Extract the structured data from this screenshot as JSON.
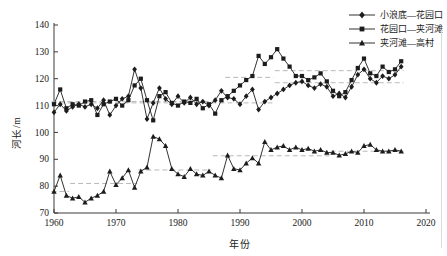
{
  "chart_data": {
    "type": "line",
    "title": "",
    "xlabel": "年份",
    "ylabel": "河长/m",
    "xlim": [
      1960,
      2020
    ],
    "ylim": [
      70,
      140
    ],
    "x_ticks": [
      1960,
      1970,
      1980,
      1990,
      2000,
      2010,
      2020
    ],
    "y_ticks": [
      70,
      80,
      90,
      100,
      110,
      120,
      130,
      140
    ],
    "grid": false,
    "legend_position": "top-right",
    "colors": {
      "line": "#1c1c1c",
      "mean_line": "#b9b9b9",
      "axis": "#3a3a3a",
      "background": "#ffffff"
    },
    "x": [
      1960,
      1961,
      1962,
      1963,
      1964,
      1965,
      1966,
      1967,
      1968,
      1969,
      1970,
      1971,
      1972,
      1973,
      1974,
      1975,
      1976,
      1977,
      1978,
      1979,
      1980,
      1981,
      1982,
      1983,
      1984,
      1985,
      1986,
      1987,
      1988,
      1989,
      1990,
      1991,
      1992,
      1993,
      1994,
      1995,
      1996,
      1997,
      1998,
      1999,
      2000,
      2001,
      2002,
      2003,
      2004,
      2005,
      2006,
      2007,
      2008,
      2009,
      2010,
      2011,
      2012,
      2013,
      2014,
      2015,
      2016
    ],
    "series": [
      {
        "name": "xiaolangdi-huayuankou",
        "label": "小浪底—花园口",
        "marker": "diamond",
        "values": [
          107.5,
          110.5,
          108,
          109.5,
          110.5,
          109.5,
          110.5,
          109,
          112,
          106.5,
          110,
          112.5,
          113.5,
          123.5,
          116.5,
          105,
          111,
          116.5,
          112.5,
          110.5,
          113.5,
          111,
          113,
          110.5,
          111.5,
          110,
          112,
          115.5,
          113,
          112.5,
          110.5,
          113.5,
          116,
          108.5,
          111.5,
          113,
          114.5,
          116,
          117.5,
          118.5,
          119,
          117.5,
          116.5,
          118,
          117,
          113.5,
          114.5,
          113,
          117,
          121.5,
          123.5,
          120,
          118.5,
          121,
          120,
          121.5,
          124.5
        ],
        "mean_segments": [
          [
            1960,
            1995,
            111
          ],
          [
            1996,
            2016,
            118.5
          ]
        ]
      },
      {
        "name": "huayuankou-jiahetan",
        "label": "花园口—夹河滩",
        "marker": "square",
        "values": [
          110.5,
          116,
          109,
          110.5,
          110,
          111.5,
          112,
          106.5,
          110.5,
          111.5,
          112.5,
          110,
          112,
          117.5,
          120,
          112,
          104.5,
          113.5,
          115,
          111,
          110,
          111.5,
          111,
          112.5,
          109,
          110.5,
          107,
          112,
          113.5,
          115.5,
          117.5,
          119.5,
          121,
          128.5,
          125.5,
          128,
          131,
          127.5,
          124.5,
          121,
          121,
          119.5,
          120.5,
          122,
          119,
          115.5,
          113.5,
          115,
          119.5,
          124,
          127.5,
          122,
          121,
          124.5,
          122.5,
          123.5,
          126.5
        ],
        "mean_segments": [
          [
            1960,
            1987,
            111.5
          ],
          [
            1988,
            1995,
            120.5
          ],
          [
            1996,
            2016,
            123
          ]
        ]
      },
      {
        "name": "jiahetan-gaocun",
        "label": "夹河滩—高村",
        "marker": "triangle",
        "values": [
          78,
          84,
          76.5,
          75.5,
          76,
          74,
          75.5,
          76.5,
          78,
          85.5,
          80.5,
          83,
          86,
          79.5,
          85.5,
          87,
          98.5,
          97.5,
          95,
          86.5,
          84.5,
          83.5,
          86.5,
          84.5,
          84,
          85.5,
          84,
          83,
          91.5,
          86.5,
          86,
          88.5,
          90.5,
          88.5,
          96.5,
          93.5,
          94.5,
          95,
          93.5,
          94.5,
          93.5,
          94,
          93,
          93.5,
          92.5,
          92.5,
          91.5,
          92,
          93,
          92.5,
          95,
          95.5,
          93.5,
          93,
          93,
          93.5,
          93
        ],
        "mean_segments": [
          [
            1960,
            1962,
            78
          ],
          [
            1963,
            1973,
            81
          ],
          [
            1974,
            1985,
            86
          ],
          [
            1986,
            2004,
            91.3
          ],
          [
            2005,
            2016,
            93
          ]
        ]
      }
    ]
  }
}
